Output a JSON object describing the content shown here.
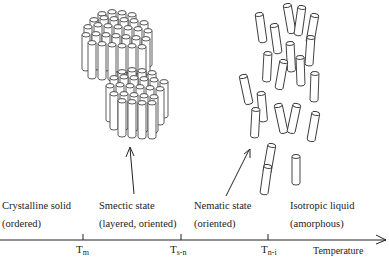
{
  "diagram": {
    "type": "phase-transition-diagram",
    "axis": {
      "label": "Temperature",
      "ticks": [
        {
          "symbol": "T",
          "subscript": "m"
        },
        {
          "symbol": "T",
          "subscript": "s-n"
        },
        {
          "symbol": "T",
          "subscript": "n-i"
        }
      ]
    },
    "phases": [
      {
        "name": "Crystalline solid",
        "description": "(ordered)"
      },
      {
        "name": "Smectic state",
        "description": "(layered, oriented)"
      },
      {
        "name": "Nematic state",
        "description": "(oriented)"
      },
      {
        "name": "Isotropic liquid",
        "description": "(amorphous)"
      }
    ],
    "illustrations": [
      {
        "name": "smectic-layers",
        "description": "two stacked layers of aligned rods"
      },
      {
        "name": "nematic-rods",
        "description": "loosely aligned scattered rods"
      }
    ],
    "colors": {
      "line": "#222222",
      "fill": "#ffffff"
    }
  }
}
